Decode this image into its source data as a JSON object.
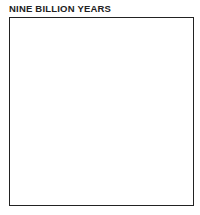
{
  "figure": {
    "title": "NINE BILLION YEARS",
    "panel": {
      "description": "Simulated particle distribution showing cellular voids bounded by dark filaments",
      "ink_color": "#1a1a1a",
      "background_color": "#ffffff"
    }
  }
}
